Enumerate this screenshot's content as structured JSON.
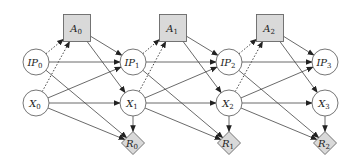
{
  "diagram": {
    "title": "",
    "colors": {
      "action_fill": "#d9d9d9",
      "reward_fill": "#d9d9d9",
      "state_fill": "#ffffff",
      "stroke": "#666666",
      "edge": "#444444"
    },
    "nodes": [
      {
        "id": "A0",
        "base": "A",
        "sub": "0",
        "shape": "square",
        "x": 77,
        "y": 28
      },
      {
        "id": "A1",
        "base": "A",
        "sub": "1",
        "shape": "square",
        "x": 173,
        "y": 28
      },
      {
        "id": "A2",
        "base": "A",
        "sub": "2",
        "shape": "square",
        "x": 270,
        "y": 28
      },
      {
        "id": "IP0",
        "base": "IP",
        "sub": "0",
        "shape": "circle",
        "x": 36,
        "y": 62
      },
      {
        "id": "IP1",
        "base": "IP",
        "sub": "1",
        "shape": "circle",
        "x": 133,
        "y": 62
      },
      {
        "id": "IP2",
        "base": "IP",
        "sub": "2",
        "shape": "circle",
        "x": 229,
        "y": 62
      },
      {
        "id": "IP3",
        "base": "IP",
        "sub": "3",
        "shape": "circle",
        "x": 325,
        "y": 62
      },
      {
        "id": "X0",
        "base": "X",
        "sub": "0",
        "shape": "circle",
        "x": 36,
        "y": 103
      },
      {
        "id": "X1",
        "base": "X",
        "sub": "1",
        "shape": "circle",
        "x": 133,
        "y": 103
      },
      {
        "id": "X2",
        "base": "X",
        "sub": "2",
        "shape": "circle",
        "x": 229,
        "y": 103
      },
      {
        "id": "X3",
        "base": "X",
        "sub": "3",
        "shape": "circle",
        "x": 325,
        "y": 103
      },
      {
        "id": "R0",
        "base": "R",
        "sub": "0",
        "shape": "diamond",
        "x": 133,
        "y": 143
      },
      {
        "id": "R1",
        "base": "R",
        "sub": "1",
        "shape": "diamond",
        "x": 229,
        "y": 143
      },
      {
        "id": "R2",
        "base": "R",
        "sub": "2",
        "shape": "diamond",
        "x": 325,
        "y": 143
      }
    ],
    "edges": [
      {
        "from": "IP0",
        "to": "A0",
        "style": "dotted"
      },
      {
        "from": "X0",
        "to": "A0",
        "style": "dotted"
      },
      {
        "from": "A0",
        "to": "IP1",
        "style": "solid"
      },
      {
        "from": "A0",
        "to": "X1",
        "style": "solid"
      },
      {
        "from": "IP0",
        "to": "IP1",
        "style": "solid"
      },
      {
        "from": "IP0",
        "to": "R0",
        "style": "solid"
      },
      {
        "from": "X0",
        "to": "IP1",
        "style": "solid"
      },
      {
        "from": "X0",
        "to": "X1",
        "style": "solid"
      },
      {
        "from": "X0",
        "to": "R0",
        "style": "solid"
      },
      {
        "from": "X1",
        "to": "R0",
        "style": "solid"
      },
      {
        "from": "IP1",
        "to": "A1",
        "style": "dotted"
      },
      {
        "from": "X1",
        "to": "A1",
        "style": "dotted"
      },
      {
        "from": "A1",
        "to": "IP2",
        "style": "solid"
      },
      {
        "from": "A1",
        "to": "X2",
        "style": "solid"
      },
      {
        "from": "IP1",
        "to": "IP2",
        "style": "solid"
      },
      {
        "from": "IP1",
        "to": "R1",
        "style": "solid"
      },
      {
        "from": "X1",
        "to": "IP2",
        "style": "solid"
      },
      {
        "from": "X1",
        "to": "X2",
        "style": "solid"
      },
      {
        "from": "X1",
        "to": "R1",
        "style": "solid"
      },
      {
        "from": "X2",
        "to": "R1",
        "style": "solid"
      },
      {
        "from": "IP2",
        "to": "A2",
        "style": "dotted"
      },
      {
        "from": "X2",
        "to": "A2",
        "style": "dotted"
      },
      {
        "from": "A2",
        "to": "IP3",
        "style": "solid"
      },
      {
        "from": "A2",
        "to": "X3",
        "style": "solid"
      },
      {
        "from": "IP2",
        "to": "IP3",
        "style": "solid"
      },
      {
        "from": "IP2",
        "to": "R2",
        "style": "solid"
      },
      {
        "from": "X2",
        "to": "IP3",
        "style": "solid"
      },
      {
        "from": "X2",
        "to": "X3",
        "style": "solid"
      },
      {
        "from": "X2",
        "to": "R2",
        "style": "solid"
      },
      {
        "from": "X3",
        "to": "R2",
        "style": "solid"
      }
    ]
  }
}
